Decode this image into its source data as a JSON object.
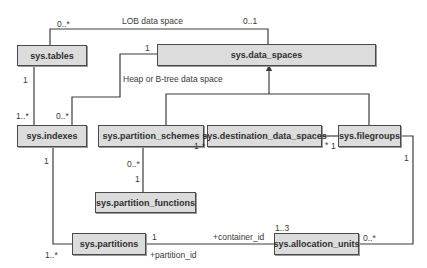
{
  "diagram": {
    "type": "entity-relationship",
    "entities": {
      "tables": "sys.tables",
      "data_spaces": "sys.data_spaces",
      "indexes": "sys.indexes",
      "partition_schemes": "sys.partition_schemes",
      "destination_data_spaces": "sys.destination_data_spaces",
      "filegroups": "sys.filegroups",
      "partition_functions": "sys.partition_functions",
      "partitions": "sys.partitions",
      "allocation_units": "sys.allocation_units"
    },
    "labels": {
      "lob_data_space": "LOB data space",
      "heap_btree_data_space": "Heap or B-tree data space",
      "container_id": "+container_id",
      "partition_id": "+partition_id"
    },
    "multiplicities": {
      "tables_lob": "0..*",
      "data_spaces_lob": "0..1",
      "data_spaces_heap": "1",
      "tables_indexes": "1",
      "indexes_tables": "1..*",
      "indexes_heap": "0..*",
      "schemes_dest": "1",
      "dest_schemes": "*",
      "dest_filegroups": "*",
      "filegroups_dest": "1",
      "schemes_functions": "0..*",
      "functions_schemes": "1",
      "indexes_partitions": "1",
      "partitions_indexes": "1..*",
      "partitions_alloc": "1",
      "alloc_partitions": "1..3",
      "alloc_filegroups": "0..*",
      "filegroups_alloc": "1"
    },
    "relationships": [
      {
        "from": "sys.tables",
        "to": "sys.data_spaces",
        "label": "LOB data space",
        "from_mult": "0..*",
        "to_mult": "0..1"
      },
      {
        "from": "sys.indexes",
        "to": "sys.data_spaces",
        "label": "Heap or B-tree data space",
        "from_mult": "0..*",
        "to_mult": "1"
      },
      {
        "from": "sys.tables",
        "to": "sys.indexes",
        "from_mult": "1",
        "to_mult": "1..*"
      },
      {
        "from": "sys.partition_schemes",
        "to": "sys.data_spaces",
        "kind": "inheritance"
      },
      {
        "from": "sys.filegroups",
        "to": "sys.data_spaces",
        "kind": "inheritance"
      },
      {
        "from": "sys.partition_schemes",
        "to": "sys.destination_data_spaces",
        "from_mult": "1",
        "to_mult": "*"
      },
      {
        "from": "sys.destination_data_spaces",
        "to": "sys.filegroups",
        "from_mult": "*",
        "to_mult": "1"
      },
      {
        "from": "sys.partition_schemes",
        "to": "sys.partition_functions",
        "from_mult": "0..*",
        "to_mult": "1"
      },
      {
        "from": "sys.indexes",
        "to": "sys.partitions",
        "from_mult": "1",
        "to_mult": "1..*"
      },
      {
        "from": "sys.partitions",
        "to": "sys.allocation_units",
        "label_from": "+partition_id",
        "label_to": "+container_id",
        "from_mult": "1",
        "to_mult": "1..3"
      },
      {
        "from": "sys.allocation_units",
        "to": "sys.filegroups",
        "from_mult": "0..*",
        "to_mult": "1"
      }
    ]
  }
}
